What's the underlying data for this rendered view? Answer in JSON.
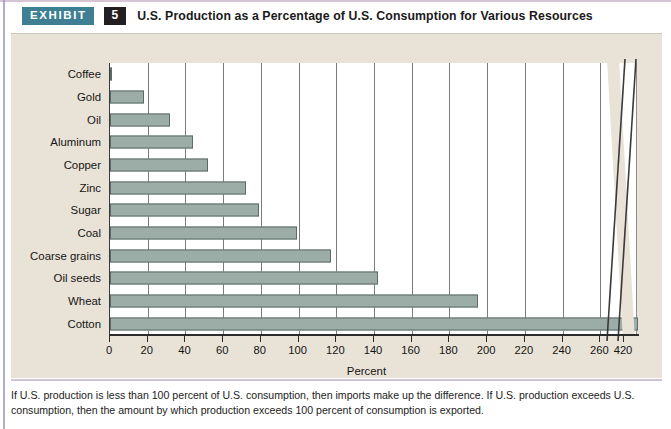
{
  "header": {
    "tag_label": "EXHIBIT",
    "number": "5",
    "title": "U.S. Production as a Percentage of U.S. Consumption for Various Resources"
  },
  "colors": {
    "tag_background": "#3f7f93",
    "number_background": "#231f20",
    "panel_background": "#e9e3d7",
    "plot_background": "#ffffff",
    "bar_fill": "#9cada7",
    "bar_border": "#5c6b68",
    "gridline": "#7b7b7b",
    "axis": "#2b2b2b",
    "edge_stripe": "#a39ec4"
  },
  "footnote": {
    "line1": "If U.S. production is less than 100 percent of U.S. consumption, then imports make up the difference. If U.S. production exceeds U.S. consumption,",
    "line2": "then the amount by which production exceeds 100 percent of consumption is exported."
  },
  "chart_data": {
    "type": "bar",
    "orientation": "horizontal",
    "title": "U.S. Production as a Percentage of U.S. Consumption for Various Resources",
    "xlabel": "Percent",
    "ylabel": "",
    "categories": [
      "Coffee",
      "Gold",
      "Oil",
      "Aluminum",
      "Copper",
      "Zinc",
      "Sugar",
      "Coal",
      "Coarse grains",
      "Oil seeds",
      "Wheat",
      "Cotton"
    ],
    "values": [
      1,
      18,
      32,
      44,
      52,
      72,
      79,
      99,
      117,
      142,
      195,
      420
    ],
    "tick_values": [
      0,
      20,
      40,
      60,
      80,
      100,
      120,
      140,
      160,
      180,
      200,
      220,
      240,
      260,
      420
    ],
    "tick_labels": [
      "0",
      "20",
      "40",
      "60",
      "80",
      "100",
      "120",
      "140",
      "160",
      "180",
      "200",
      "220",
      "240",
      "260",
      "420"
    ],
    "xlim": [
      0,
      280
    ],
    "axis_break": {
      "after": 260,
      "resumes_at": 420,
      "note": "axis break between 260 and 420"
    },
    "grid": true,
    "legend": "none"
  }
}
